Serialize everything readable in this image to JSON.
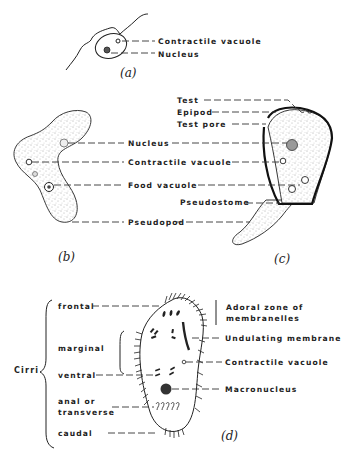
{
  "figure": {
    "panels": {
      "a": {
        "caption": "(a)",
        "labels": [
          "Contractile vacuole",
          "Nucleus"
        ]
      },
      "b": {
        "caption": "(b)",
        "shared_labels": [
          "Nucleus",
          "Contractile vacuole",
          "Food vacuole",
          "Pseudopod"
        ]
      },
      "c": {
        "caption": "(c)",
        "labels": [
          "Test",
          "Epipod",
          "Test pore",
          "Pseudostome"
        ]
      },
      "d": {
        "caption": "(d)",
        "group_label": "Cirri",
        "cirri_labels": [
          "frontal",
          "marginal",
          "ventral",
          "anal or",
          "transverse",
          "caudal"
        ],
        "right_labels": [
          "Adoral zone of",
          "membranelles",
          "Undulating membrane",
          "Contractile vacuole",
          "Macronucleus"
        ]
      }
    }
  }
}
